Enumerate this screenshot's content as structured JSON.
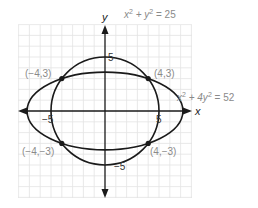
{
  "figure": {
    "title_top": "",
    "axes": {
      "x_label": "x",
      "y_label": "y",
      "x_ticks": [
        {
          "value": -5,
          "label": "−5"
        },
        {
          "value": 5,
          "label": "5"
        }
      ],
      "y_ticks": [
        {
          "value": 5,
          "label": "5"
        },
        {
          "value": -5,
          "label": "−5"
        }
      ]
    },
    "curves": [
      {
        "name": "circle",
        "equation": "x² + y² = 25",
        "eq_parts": {
          "a": "x",
          "b": "2",
          "c": " + y",
          "d": "2",
          "e": " = 25"
        }
      },
      {
        "name": "ellipse",
        "equation": "x² + 4y² = 52",
        "eq_parts": {
          "a": "x",
          "b": "2",
          "c": " + 4y",
          "d": "2",
          "e": " = 52"
        }
      }
    ],
    "intersection_points": [
      {
        "x": -4,
        "y": 3,
        "label": "(−4,3)"
      },
      {
        "x": 4,
        "y": 3,
        "label": "(4,3)"
      },
      {
        "x": -4,
        "y": -3,
        "label": "(−4,−3)"
      },
      {
        "x": 4,
        "y": -3,
        "label": "(4,−3)"
      }
    ],
    "colors": {
      "grid": "#e3e3e3",
      "curve": "#1a1a1a",
      "label": "#8a8a8a"
    }
  }
}
